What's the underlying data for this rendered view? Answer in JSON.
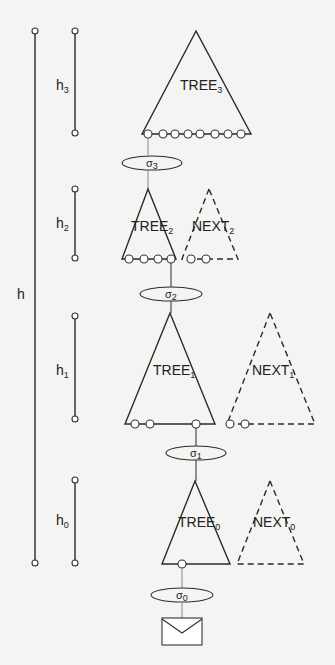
{
  "diagram": {
    "height_labels": {
      "total": "h",
      "h3": {
        "base": "h",
        "sub": "3"
      },
      "h2": {
        "base": "h",
        "sub": "2"
      },
      "h1": {
        "base": "h",
        "sub": "1"
      },
      "h0": {
        "base": "h",
        "sub": "0"
      }
    },
    "trees": [
      {
        "name": "TREE",
        "sub": "3",
        "leaf_count": 8
      },
      {
        "name": "TREE",
        "sub": "2",
        "leaf_count": 4
      },
      {
        "name": "TREE",
        "sub": "1",
        "leaf_count": 3
      },
      {
        "name": "TREE",
        "sub": "0",
        "leaf_count": 1
      }
    ],
    "next_trees": [
      {
        "name": "NEXT",
        "sub": "2",
        "leaf_count": 2
      },
      {
        "name": "NEXT",
        "sub": "1",
        "leaf_count": 2
      },
      {
        "name": "NEXT",
        "sub": "0",
        "leaf_count": 0
      }
    ],
    "signatures": [
      {
        "symbol": "σ",
        "sub": "3"
      },
      {
        "symbol": "σ",
        "sub": "2"
      },
      {
        "symbol": "σ",
        "sub": "1"
      },
      {
        "symbol": "σ",
        "sub": "0"
      }
    ],
    "message_icon": "envelope-icon"
  }
}
